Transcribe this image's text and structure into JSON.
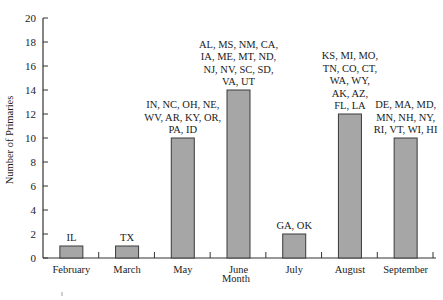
{
  "chart_data": {
    "type": "bar",
    "title": "",
    "xlabel": "Month",
    "ylabel": "Number of Primaries",
    "ylim": [
      0,
      20
    ],
    "yticks": [
      0,
      2,
      4,
      6,
      8,
      10,
      12,
      14,
      16,
      18,
      20
    ],
    "grid": false,
    "legend": null,
    "categories": [
      "February",
      "March",
      "May",
      "June",
      "July",
      "August",
      "September"
    ],
    "values": [
      1,
      1,
      10,
      14,
      2,
      12,
      10
    ],
    "bar_color": "#a6a6a6",
    "bar_edge_color": "#3a3a3a",
    "annotations": [
      [
        "IL"
      ],
      [
        "TX"
      ],
      [
        "IN, NC, OH, NE,",
        "WV, AR, KY, OR,",
        "PA, ID"
      ],
      [
        "AL, MS, NM, CA,",
        "IA, ME, MT, ND,",
        "NJ, NV, SC, SD,",
        "VA, UT"
      ],
      [
        "GA, OK"
      ],
      [
        "KS, MI, MO,",
        "TN, CO, CT,",
        "WA, WY,",
        "AK, AZ,",
        "FL, LA"
      ],
      [
        "DE, MA, MD,",
        "MN, NH, NY,",
        "RI, VT, WI, HI"
      ]
    ]
  }
}
